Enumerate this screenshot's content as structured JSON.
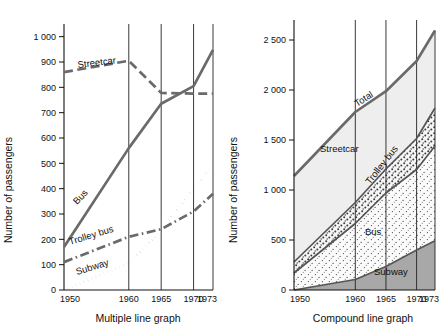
{
  "figure": {
    "axis_title": "Number of passengers",
    "colors": {
      "ink": "#111111",
      "line_gray": "#6a6a6a",
      "band_streetcar": "#eeeeee",
      "band_trolleybus": "#f7f7f7",
      "band_bus": "#fafafa",
      "band_subway": "#a8a8a8",
      "band_outline": "#555555"
    }
  },
  "chart_data": [
    {
      "type": "line",
      "id": "multiple-line-graph",
      "title": "Multiple line graph",
      "caption": "Multiple line graph",
      "xlabel": "",
      "ylabel": "Number of passengers",
      "x": [
        1950,
        1960,
        1965,
        1970,
        1973
      ],
      "xticklabels": [
        "1950",
        "1960",
        "1965",
        "1970",
        "1973"
      ],
      "xlim": [
        1950,
        1973
      ],
      "ylim": [
        0,
        1050
      ],
      "yticks": [
        0,
        100,
        200,
        300,
        400,
        500,
        600,
        700,
        800,
        900,
        1000
      ],
      "yticklabels": [
        "0",
        "100",
        "200",
        "300",
        "400",
        "500",
        "600",
        "700",
        "800",
        "900",
        "1 000"
      ],
      "grid": "vertical-at-xticks",
      "legend": "inline-labels",
      "series": [
        {
          "name": "Streetcar",
          "style": "dashed",
          "label": "Streetcar",
          "values": [
            860,
            905,
            778,
            775,
            775
          ]
        },
        {
          "name": "Bus",
          "style": "solid",
          "label": "Bus",
          "values": [
            170,
            560,
            735,
            805,
            948
          ]
        },
        {
          "name": "Trolley bus",
          "style": "dash-dot",
          "label": "Trolley bus",
          "values": [
            110,
            210,
            240,
            310,
            380
          ]
        },
        {
          "name": "Subway",
          "style": "dotted",
          "label": "Subway",
          "values": [
            0,
            105,
            235,
            400,
            492
          ]
        }
      ]
    },
    {
      "type": "area",
      "id": "compound-line-graph",
      "title": "Compound line graph",
      "caption": "Compound line graph",
      "xlabel": "",
      "ylabel": "Number of passengers",
      "stacked": true,
      "x": [
        1950,
        1960,
        1965,
        1970,
        1973
      ],
      "xticklabels": [
        "1950",
        "1960",
        "1965",
        "1970",
        "1973"
      ],
      "xlim": [
        1950,
        1973
      ],
      "ylim": [
        0,
        2700
      ],
      "yticks": [
        0,
        500,
        1000,
        1500,
        2000,
        2500
      ],
      "yticklabels": [
        "0",
        "500",
        "1 000",
        "1 500",
        "2 000",
        "2 500"
      ],
      "grid": "vertical-at-xticks",
      "legend": "inline-labels",
      "series": [
        {
          "name": "Subway",
          "label": "Subway",
          "fill": "dark-gray",
          "values": [
            0,
            105,
            235,
            400,
            492
          ]
        },
        {
          "name": "Bus",
          "label": "Bus",
          "fill": "fine-stipple",
          "values": [
            170,
            560,
            735,
            805,
            948
          ]
        },
        {
          "name": "Trolley bus",
          "label": "Trolley bus",
          "fill": "coarse-stipple",
          "values": [
            110,
            210,
            240,
            310,
            380
          ]
        },
        {
          "name": "Streetcar",
          "label": "Streetcar",
          "fill": "light-gray",
          "values": [
            860,
            905,
            778,
            775,
            775
          ]
        }
      ],
      "total": {
        "name": "Total",
        "label": "Total",
        "values": [
          1140,
          1780,
          1988,
          2290,
          2595
        ]
      }
    }
  ]
}
